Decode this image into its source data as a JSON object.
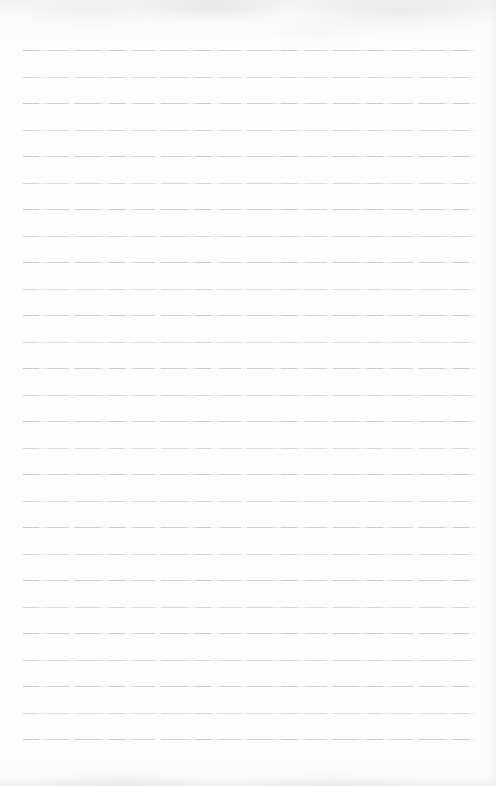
{
  "page": {
    "kind": "blank-ruled-notebook-paper",
    "text_content": "",
    "background_color": "#fdfdfd",
    "rule_color": "#949da2",
    "rule_count": 27,
    "rule_first_y": 50,
    "rule_spacing": 26.5,
    "rule_left": 23,
    "rule_width": 452
  }
}
